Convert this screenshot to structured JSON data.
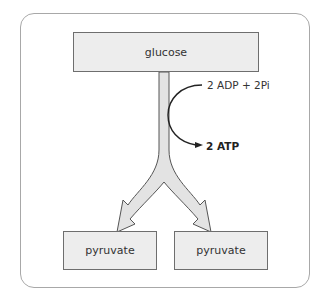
{
  "diagram": {
    "nodes": {
      "top": "glucose",
      "bottom_left": "pyruvate",
      "bottom_right": "pyruvate"
    },
    "side_reaction": {
      "input": "2 ADP + 2Pi",
      "output": "2 ATP"
    }
  },
  "colors": {
    "box_fill": "#ededed",
    "box_border": "#6e6e6e",
    "frame_border": "#a8a8a8",
    "arrow_fill": "#e3e3e3",
    "text": "#333333"
  }
}
